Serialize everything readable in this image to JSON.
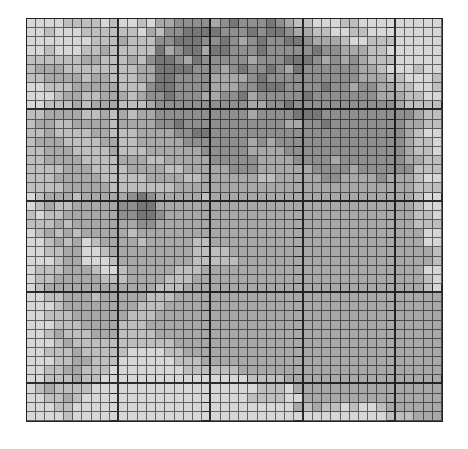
{
  "mosaic": {
    "columns": 45,
    "rows": 44,
    "major_every": 10,
    "palette": [
      "#d7d7d7",
      "#bebebe",
      "#a8a8a8",
      "#8f8f8f",
      "#777777"
    ],
    "cells": [
      "000011110100102233332343334321100011000000000",
      "001000111111021334444333434432211001100000000",
      "000000011121113344433432343344322210011100000",
      "001000112111114234424433343333343322211000000",
      "111111221112134432433333233344432323211100000",
      "122211111111224444333234334324333333221000100",
      "112222122111224433332222343333333333222110001",
      "001112222211134433332223344433334332332211001",
      "000122112221233433322334233333433333332221100",
      "001112122211123333333333223343333333333321111",
      "112222112121223333333333233334443333333333211",
      "122112222122223343333333333322334333333332211",
      "112111122111222233443333333333333333333332100",
      "122211112211222223333333232333333333333332110",
      "112221111211122222233333222233333333333332110",
      "112222111122211222223333322223333233333332211",
      "111122211112222112222233322222233332333333111",
      "111222221111122221122222211222223322223222100",
      "111122222111111122222222222222222222222222111",
      "012221222223432222212222222222222222222222100",
      "012112222233442222222222222222222222222222100",
      "101122222233443222222222222222222222222222110",
      "111212222222332222222222222222222222222222111",
      "012121222221222222222222222222222222222222200",
      "001212012222122222112222222222222222222222200",
      "001122001222222222111122222222222222222222221",
      "000122000122222222111112222222222222222222221",
      "011122210012222211122222222222222222222222200",
      "011222221112222111222222222222222222222222210",
      "012222222222221112222222222222222222222222210",
      "001122212222211122222222222222222222222222222",
      "000122222222111222222222222222222222222222222",
      "001112222221112222222222222222222222222222222",
      "000111222211122222222222222222222222222222222",
      "001211122211112222222222222222222222222222222",
      "000121111111111122222222222222222222222222222",
      "001112111110000112222222222222222222222222222",
      "000112211100000011122222222222222222222222222",
      "001122111000000001111112222222222222222222222",
      "001112110000000000000000111122222222222222222",
      "012111100000000000000000011102222222222222222",
      "001121000000000000000000111100222222222222222",
      "000110000000000000000000000002121101001222222",
      "000010000000000000000000000000000000000111222"
    ]
  }
}
